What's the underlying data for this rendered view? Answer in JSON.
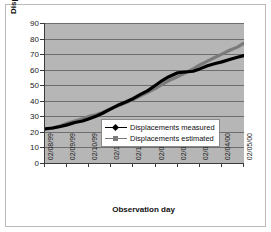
{
  "chart_data": {
    "type": "line",
    "title": "",
    "xlabel": "Observation day",
    "ylabel": "Displacements ( mm/10 )",
    "ylim": [
      0,
      90
    ],
    "yticks": [
      0,
      10,
      20,
      30,
      40,
      50,
      60,
      70,
      80,
      90
    ],
    "grid": true,
    "legend_position": "center",
    "categories": [
      "02/08/99",
      "02/09/99",
      "02/10/99",
      "02/11/99",
      "02/12/99",
      "02/01/00",
      "02/02/00",
      "02/03/00",
      "02/04/00",
      "02/05/00"
    ],
    "series": [
      {
        "name": "Displacements measured",
        "color": "#000000",
        "marker": "diamond",
        "x": [
          0,
          0.35,
          0.7,
          1,
          1.35,
          1.7,
          2,
          2.3,
          2.6,
          3,
          3.35,
          3.7,
          4,
          4.3,
          4.65,
          5,
          5.3,
          5.6,
          6,
          6.35,
          6.7,
          7,
          7.35,
          7.7,
          8,
          8.35,
          8.7,
          9
        ],
        "values": [
          22,
          22.5,
          23.5,
          24.5,
          26,
          27,
          28.5,
          30,
          32,
          35,
          37.5,
          39.5,
          41.5,
          44,
          46.5,
          50,
          53,
          55.5,
          58,
          58.5,
          59,
          60.5,
          62.5,
          64,
          65,
          66.5,
          68,
          69
        ]
      },
      {
        "name": "Displacements estimated",
        "color": "#7a7a7a",
        "marker": "square",
        "x": [
          0,
          0.35,
          0.7,
          1,
          1.35,
          1.7,
          2,
          2.3,
          2.6,
          3,
          3.35,
          3.7,
          4,
          4.3,
          4.65,
          5,
          5.3,
          5.6,
          6,
          6.35,
          6.7,
          7,
          7.35,
          7.7,
          8,
          8.35,
          8.7,
          9
        ],
        "values": [
          21.5,
          22.5,
          24,
          25.5,
          27,
          28.5,
          30,
          31,
          32.5,
          35,
          37,
          39,
          41,
          43,
          45.5,
          48,
          50.5,
          53,
          55.5,
          58,
          60.5,
          63,
          65.5,
          68,
          70,
          72.5,
          74.5,
          77
        ]
      }
    ]
  },
  "legend": {
    "items": [
      {
        "label": "Displacements measured"
      },
      {
        "label": "Displacements estimated"
      }
    ]
  }
}
